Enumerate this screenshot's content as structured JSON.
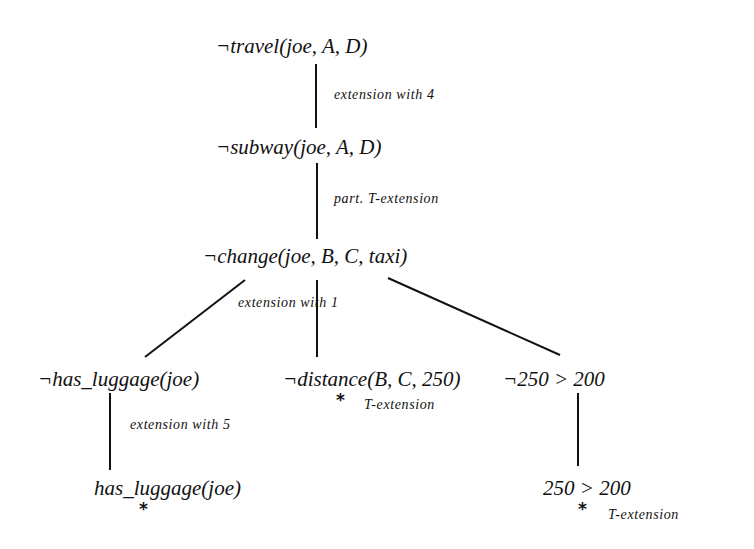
{
  "diagram": {
    "type": "tableau-proof-tree",
    "nodes": [
      {
        "id": "n1",
        "text": "¬travel(joe, A, D)"
      },
      {
        "id": "n2",
        "text": "¬subway(joe, A, D)"
      },
      {
        "id": "n3",
        "text": "¬change(joe, B, C, taxi)"
      },
      {
        "id": "n4",
        "text": "¬has_luggage(joe)"
      },
      {
        "id": "n5",
        "text": "¬distance(B, C, 250)"
      },
      {
        "id": "n6",
        "text": "¬250 > 200"
      },
      {
        "id": "n7",
        "text": "has_luggage(joe)"
      },
      {
        "id": "n8",
        "text": "250 > 200"
      }
    ],
    "edges": [
      {
        "from": "n1",
        "to": "n2",
        "label": "extension with 4"
      },
      {
        "from": "n2",
        "to": "n3",
        "label": "part. T-extension"
      },
      {
        "from": "n3",
        "to": "n4",
        "label": "extension with 1"
      },
      {
        "from": "n3",
        "to": "n5",
        "label": ""
      },
      {
        "from": "n3",
        "to": "n6",
        "label": ""
      },
      {
        "from": "n4",
        "to": "n7",
        "label": "extension with 5"
      },
      {
        "from": "n6",
        "to": "n8",
        "label": ""
      }
    ],
    "closed_markers": [
      {
        "node": "n5",
        "symbol": "*",
        "label": "T-extension"
      },
      {
        "node": "n7",
        "symbol": "*",
        "label": ""
      },
      {
        "node": "n8",
        "symbol": "*",
        "label": "T-extension"
      }
    ]
  }
}
